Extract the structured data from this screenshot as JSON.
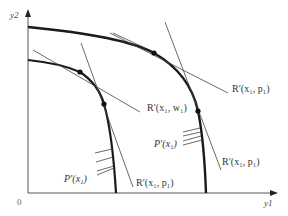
{
  "figure": {
    "type": "diagram",
    "colors": {
      "curve": "#1a1a1a",
      "thin_line": "#444444",
      "background": "#ffffff",
      "text": "#333333"
    }
  },
  "axes": {
    "origin_label": "0",
    "x_label": "y1",
    "y_label": "y2"
  },
  "labels": {
    "r_x_w": "R′(x₁, w₁)",
    "r_x_p_outer_top": "R′(x₁, p₁)",
    "r_x_p_outer_steep": "R′(x₁, p₁)",
    "r_x_p_inner_steep": "R′(x₁, p₁)",
    "p_x_outer": "P′(x₁)",
    "p_x_inner": "P′(x₁)"
  },
  "curves": [
    {
      "name": "outer-frontier",
      "points": [
        [
          28,
          27
        ],
        [
          154,
          53
        ],
        [
          198,
          111
        ],
        [
          206,
          193
        ]
      ]
    },
    {
      "name": "inner-frontier",
      "points": [
        [
          28,
          60
        ],
        [
          80,
          72
        ],
        [
          104,
          104
        ],
        [
          116,
          193
        ]
      ]
    }
  ],
  "tangent_points": [
    {
      "name": "outer-upper-tangent",
      "x": 154,
      "y": 53
    },
    {
      "name": "outer-lower-tangent",
      "x": 198,
      "y": 111
    },
    {
      "name": "inner-upper-tangent",
      "x": 80,
      "y": 72
    },
    {
      "name": "inner-lower-tangent",
      "x": 104,
      "y": 104
    }
  ]
}
